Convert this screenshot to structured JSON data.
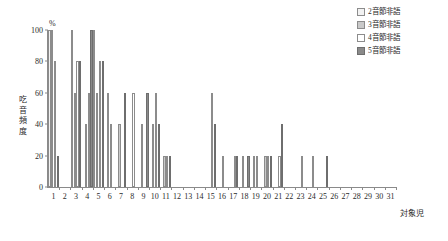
{
  "legend": {
    "position": "top-right",
    "items": [
      {
        "label": "2音節非語",
        "fill": "#f2f2f2",
        "stroke": "#8c8c8c",
        "icon": "square-outline-icon"
      },
      {
        "label": "3音節非語",
        "fill": "#c9c9c9",
        "stroke": "#8c8c8c",
        "icon": "square-light-gray-icon"
      },
      {
        "label": "4音節非語",
        "fill": "#ffffff",
        "stroke": "#8c8c8c",
        "icon": "square-outline-icon"
      },
      {
        "label": "5音節非語",
        "fill": "#8a8a8a",
        "stroke": "#6e6e6e",
        "icon": "square-dark-gray-icon"
      }
    ]
  },
  "axis": {
    "y_unit": "%",
    "y_title": "吃音頻度",
    "x_title": "対象児"
  },
  "chart_data": {
    "type": "bar",
    "title": "",
    "subtitle": "",
    "xlabel": "対象児",
    "ylabel": "吃音頻度",
    "y_unit": "%",
    "ylim": [
      0,
      100
    ],
    "yticks": [
      0,
      20,
      40,
      60,
      80,
      100
    ],
    "grid": false,
    "legend_position": "top-right",
    "categories": [
      "1",
      "2",
      "3",
      "4",
      "5",
      "6",
      "7",
      "8",
      "9",
      "10",
      "11",
      "12",
      "13",
      "14",
      "15",
      "16",
      "17",
      "18",
      "19",
      "20",
      "21",
      "22",
      "23",
      "24",
      "25",
      "26",
      "27",
      "28",
      "29",
      "30",
      "31"
    ],
    "series": [
      {
        "name": "2音節非語",
        "fill": "#f2f2f2",
        "stroke": "#8c8c8c",
        "values": [
          100,
          0,
          100,
          0,
          100,
          0,
          0,
          0,
          0,
          0,
          0,
          0,
          0,
          0,
          0,
          0,
          0,
          0,
          0,
          0,
          0,
          0,
          0,
          0,
          0,
          0,
          0,
          0,
          0,
          0,
          0
        ]
      },
      {
        "name": "3音節非語",
        "fill": "#c9c9c9",
        "stroke": "#8c8c8c",
        "values": [
          100,
          0,
          60,
          40,
          60,
          60,
          40,
          0,
          40,
          40,
          20,
          0,
          0,
          0,
          0,
          0,
          0,
          20,
          20,
          20,
          0,
          0,
          0,
          0,
          0,
          0,
          0,
          0,
          0,
          0,
          0
        ]
      },
      {
        "name": "4音節非語",
        "fill": "#ffffff",
        "stroke": "#8c8c8c",
        "values": [
          80,
          0,
          80,
          60,
          80,
          40,
          0,
          60,
          0,
          60,
          20,
          0,
          0,
          0,
          60,
          20,
          20,
          0,
          20,
          20,
          20,
          0,
          20,
          20,
          0,
          0,
          0,
          0,
          0,
          0,
          0
        ]
      },
      {
        "name": "5音節非語",
        "fill": "#8a8a8a",
        "stroke": "#6e6e6e",
        "values": [
          20,
          0,
          80,
          100,
          80,
          0,
          60,
          0,
          60,
          40,
          20,
          0,
          0,
          0,
          40,
          0,
          20,
          20,
          0,
          20,
          40,
          0,
          0,
          0,
          20,
          0,
          0,
          0,
          0,
          0,
          0
        ]
      }
    ]
  }
}
